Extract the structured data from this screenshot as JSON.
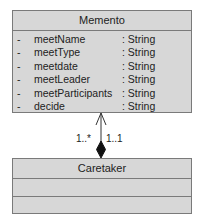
{
  "diagram": {
    "type": "uml-class",
    "classes": [
      {
        "name": "Memento",
        "attributes": [
          {
            "visibility": "-",
            "name": "meetName",
            "type": ": String"
          },
          {
            "visibility": "-",
            "name": "meetType",
            "type": ": String"
          },
          {
            "visibility": "-",
            "name": "meetdate",
            "type": ": String"
          },
          {
            "visibility": "-",
            "name": "meetLeader",
            "type": ": String"
          },
          {
            "visibility": "-",
            "name": "meetParticipants",
            "type": ": String"
          },
          {
            "visibility": "-",
            "name": "decide",
            "type": ": String"
          }
        ]
      },
      {
        "name": "Caretaker",
        "attributes": [],
        "operations": []
      }
    ],
    "relationship": {
      "kind": "composition",
      "from": "Caretaker",
      "to": "Memento",
      "navigable_end": "Memento",
      "multiplicity_left": "1..*",
      "multiplicity_right": "1..1"
    },
    "colors": {
      "box_fill": "#d7d7d7",
      "box_border": "#7a7a7a",
      "line": "#333333"
    }
  }
}
